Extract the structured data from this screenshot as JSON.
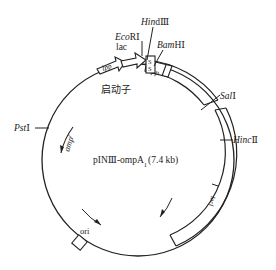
{
  "diagram": {
    "type": "plasmid-map",
    "title": "pINⅢ-ompA",
    "title_subscript": "1",
    "size": "(7.4 kb)",
    "features": {
      "lpp_promoter": "lpp",
      "lac_label": "lac",
      "promoter_label": "启动子",
      "signal_label": "S",
      "lpp_terminator": "lpp",
      "amp_label": "amp",
      "amp_sup": "r",
      "ori_label": "ori",
      "lacI_label": "lacI"
    },
    "restriction_sites": {
      "ecori_it": "Eco",
      "ecori_rest": "RⅠ",
      "hindiii_it": "Hin",
      "hindiii_rest": "dⅢ",
      "bamhi_it": "Bam",
      "bamhi_rest": "HⅠ",
      "sali_it": "Sal",
      "sali_rest": "Ⅰ",
      "pstI_it": "Pst",
      "pstI_rest": "Ⅰ",
      "hincii_it": "Hinc",
      "hincii_rest": "Ⅱ"
    },
    "colors": {
      "line": "#222222",
      "background": "#ffffff"
    }
  }
}
